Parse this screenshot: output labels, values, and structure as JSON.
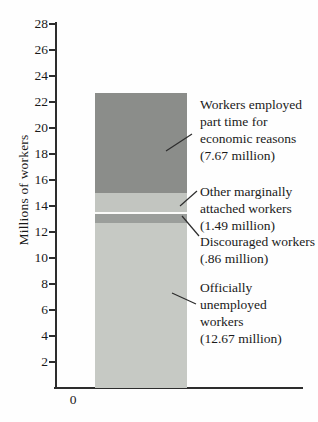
{
  "chart_data": {
    "type": "bar",
    "stacked": true,
    "orientation": "vertical",
    "title": "",
    "ylabel": "Millions of workers",
    "origin_label": "0",
    "ylim": [
      0,
      28
    ],
    "ytick_step": 2,
    "yticks": [
      2,
      4,
      6,
      8,
      10,
      12,
      14,
      16,
      18,
      20,
      22,
      24,
      26,
      28
    ],
    "grid": false,
    "legend_position": "none",
    "bar_count": 1,
    "axis_color": "#2d2d2d",
    "text_color": "#1a1a1a",
    "segments": [
      {
        "id": "officially-unemployed",
        "name": "Officially unemployed workers",
        "value": 12.67,
        "color": "#c6c9c4",
        "label": "Officially\nunemployed\nworkers\n(12.67 million)"
      },
      {
        "id": "discouraged",
        "name": "Discouraged workers",
        "value": 0.86,
        "color": "#9b9e9b",
        "separator_above": true,
        "separator_color": "#fbfbf9",
        "label": "Discouraged workers\n(.86 million)"
      },
      {
        "id": "other-marginally-attached",
        "name": "Other marginally attached workers",
        "value": 1.49,
        "color": "#c2c5c0",
        "label": "Other marginally\nattached workers\n(1.49 million)"
      },
      {
        "id": "part-time-economic",
        "name": "Workers employed part time for economic reasons",
        "value": 7.67,
        "color": "#8b8d8a",
        "label": "Workers employed\npart time for\neconomic reasons\n(7.67 million)"
      }
    ]
  }
}
